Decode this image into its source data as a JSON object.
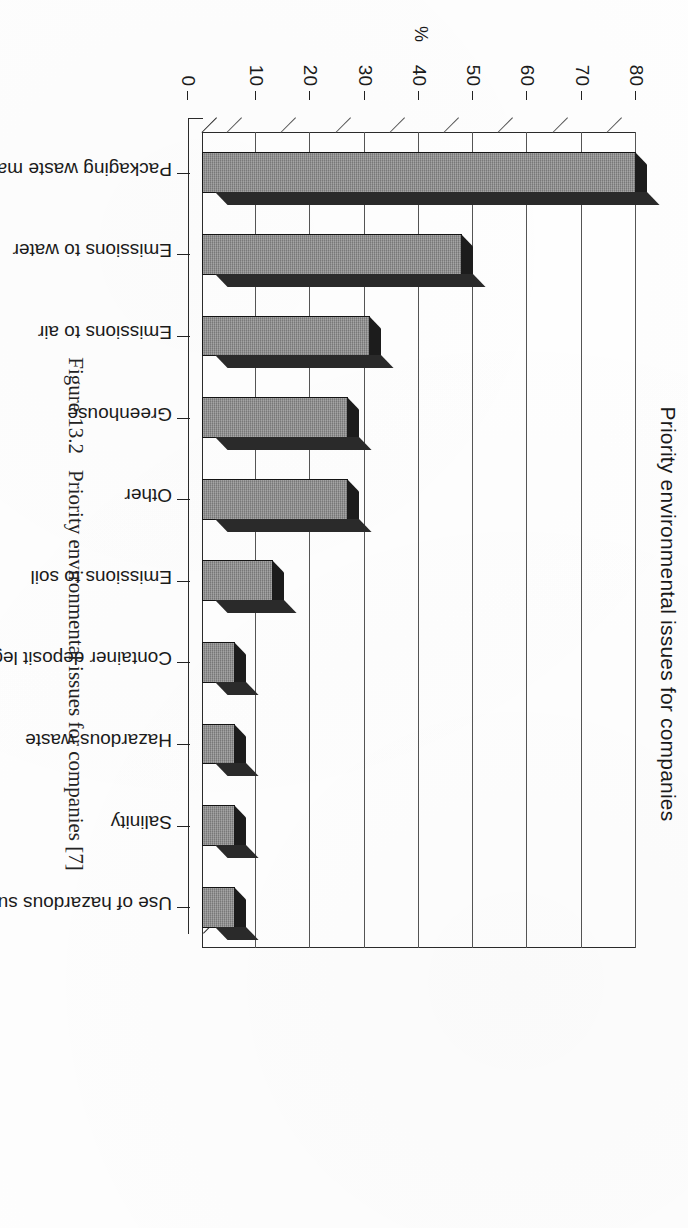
{
  "figure": {
    "number": "Figure 13.2",
    "caption": "Priority environmental issues for companies [7]"
  },
  "chart_data": {
    "type": "bar",
    "title": "Priority environmental issues for companies",
    "xlabel": "",
    "ylabel": "%",
    "axis_unit": "%",
    "ylim": [
      0,
      80
    ],
    "yticks": [
      "0",
      "10",
      "20",
      "30",
      "40",
      "50",
      "60",
      "70",
      "80"
    ],
    "grid": true,
    "legend": "none",
    "orientation": "vertical-3d",
    "categories": [
      "Packaging waste management",
      "Emissions to water",
      "Emissions to air",
      "Greenhouse",
      "Other",
      "Emissions to soil",
      "Container deposit legislation",
      "Hazardous waste",
      "Salinity",
      "Use of hazardous substances"
    ],
    "values": [
      80,
      48,
      31,
      27,
      27,
      13,
      6,
      6,
      6,
      6
    ],
    "colors": {
      "bar_face": "#8d8d8d",
      "bar_top": "#1c1c1c",
      "bar_side": "#2a2a2a",
      "axis": "#222222",
      "grid": "#555555",
      "background": "#ffffff",
      "text": "#1a1a1a"
    }
  }
}
